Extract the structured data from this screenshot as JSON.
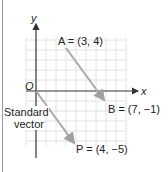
{
  "diagram": {
    "axes": {
      "x_label": "x",
      "y_label": "y",
      "origin_label": "O"
    },
    "points": {
      "A": {
        "label": "A = (3, 4)",
        "coords": [
          3,
          4
        ]
      },
      "B": {
        "label": "B = (7, −1)",
        "coords": [
          7,
          -1
        ]
      },
      "P": {
        "label": "P = (4, −5)",
        "coords": [
          4,
          -5
        ]
      }
    },
    "annotation": {
      "line1": "Standard",
      "line2": "vector"
    },
    "colors": {
      "arrow": "#a8a8a8",
      "axis": "#333333",
      "grid": "#e2e2e2"
    }
  }
}
